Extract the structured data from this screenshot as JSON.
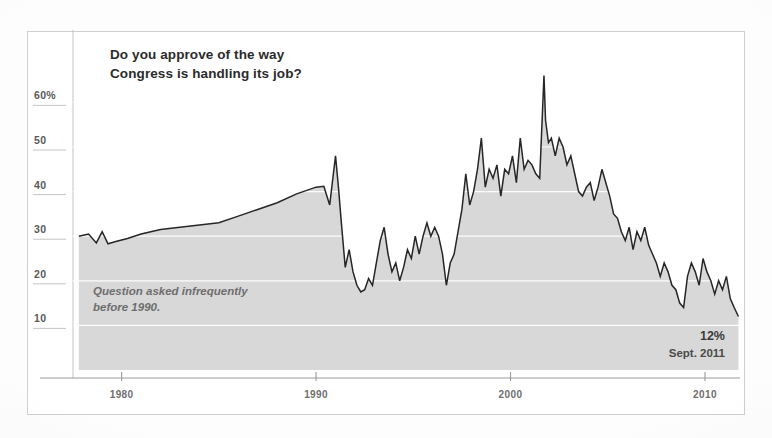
{
  "chart_data": {
    "type": "area",
    "title": "Do you approve of the way Congress is handling its job?",
    "title_line1": "Do you approve of the way",
    "title_line2": "Congress is handling its job?",
    "xlabel": "",
    "ylabel": "",
    "ylim": [
      0,
      70
    ],
    "xlim": [
      1977.5,
      2011.8
    ],
    "grid": true,
    "legend": false,
    "y_ticks": [
      10,
      20,
      30,
      40,
      50,
      60
    ],
    "y_tick_labels": [
      "10",
      "20",
      "30",
      "40",
      "50",
      "60%"
    ],
    "x_ticks": [
      1980,
      1990,
      2000,
      2010
    ],
    "x_tick_labels": [
      "1980",
      "1990",
      "2000",
      "2010"
    ],
    "annotations": [
      {
        "name": "sparse-data-note",
        "line1": "Question asked infrequently",
        "line2": "before 1990.",
        "x": 1980.2,
        "y": 16
      },
      {
        "name": "final-value-callout",
        "value": "12%",
        "date": "Sept. 2011",
        "x": 2010.3,
        "y": 7
      }
    ],
    "series": [
      {
        "name": "Congress job approval",
        "color": "#262626",
        "fill_color": "#d8d8d8",
        "x": [
          1977.8,
          1978.3,
          1978.7,
          1979.0,
          1979.3,
          1979.7,
          1980.3,
          1981.0,
          1982.0,
          1983.0,
          1984.0,
          1985.0,
          1986.0,
          1987.0,
          1988.0,
          1989.0,
          1990.0,
          1990.4,
          1990.7,
          1991.0,
          1991.15,
          1991.3,
          1991.5,
          1991.7,
          1991.9,
          1992.1,
          1992.3,
          1992.5,
          1992.7,
          1992.9,
          1993.1,
          1993.3,
          1993.5,
          1993.7,
          1993.9,
          1994.1,
          1994.3,
          1994.5,
          1994.7,
          1994.9,
          1995.1,
          1995.3,
          1995.5,
          1995.7,
          1995.9,
          1996.1,
          1996.3,
          1996.5,
          1996.7,
          1996.9,
          1997.1,
          1997.3,
          1997.5,
          1997.7,
          1997.9,
          1998.1,
          1998.3,
          1998.5,
          1998.7,
          1998.9,
          1999.1,
          1999.3,
          1999.5,
          1999.7,
          1999.9,
          2000.1,
          2000.3,
          2000.5,
          2000.7,
          2000.9,
          2001.1,
          2001.3,
          2001.5,
          2001.72,
          2001.8,
          2001.95,
          2002.1,
          2002.3,
          2002.5,
          2002.7,
          2002.9,
          2003.1,
          2003.3,
          2003.5,
          2003.7,
          2003.9,
          2004.1,
          2004.3,
          2004.5,
          2004.7,
          2004.9,
          2005.1,
          2005.3,
          2005.5,
          2005.7,
          2005.9,
          2006.1,
          2006.3,
          2006.5,
          2006.7,
          2006.9,
          2007.1,
          2007.3,
          2007.5,
          2007.7,
          2007.9,
          2008.1,
          2008.3,
          2008.5,
          2008.7,
          2008.9,
          2009.1,
          2009.3,
          2009.5,
          2009.7,
          2009.9,
          2010.1,
          2010.3,
          2010.5,
          2010.7,
          2010.9,
          2011.1,
          2011.3,
          2011.5,
          2011.72
        ],
        "y": [
          30,
          30.5,
          28.5,
          31,
          28.3,
          28.8,
          29.5,
          30.5,
          31.5,
          32,
          32.5,
          33,
          34.5,
          36,
          37.5,
          39.5,
          41,
          41.2,
          37,
          48,
          41,
          33,
          23,
          27,
          22,
          19,
          17.5,
          18,
          20.5,
          19,
          24,
          29,
          32,
          26,
          22,
          24,
          20,
          23,
          27,
          25,
          30,
          26,
          30,
          33,
          30,
          32,
          30,
          26,
          19,
          24,
          26,
          31,
          36,
          44,
          37,
          40,
          45,
          52,
          41,
          45,
          43,
          46,
          39,
          45,
          44,
          48,
          42,
          52,
          45,
          47,
          46,
          44,
          43,
          66,
          56,
          51,
          52,
          48,
          52,
          50,
          46,
          48,
          44,
          40,
          39,
          41,
          42,
          38,
          41,
          45,
          42,
          39,
          35,
          34,
          31,
          29,
          32,
          27,
          31,
          29,
          32,
          28,
          26,
          24,
          21,
          24,
          22,
          19,
          18,
          15,
          14,
          21,
          24,
          22,
          19,
          25,
          22,
          20,
          17,
          20,
          18,
          21,
          16,
          14,
          12
        ]
      }
    ]
  },
  "figure": {
    "background_color": "#ffffff",
    "frame_color": "#cfcfcf",
    "area_color": "#d8d8d8",
    "line_color": "#262626",
    "gridline_color": "#ffffff",
    "axis_color": "#9a9a9a"
  }
}
